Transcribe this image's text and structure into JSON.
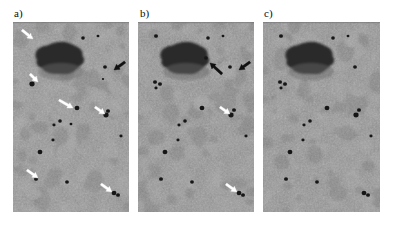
{
  "figure": {
    "type": "micrograph-panel-figure",
    "background_color": "#ffffff",
    "panel_count": 3,
    "image_width": 393,
    "image_height": 226
  },
  "panels": [
    {
      "id": "a",
      "label": "a)",
      "label_x": 14,
      "label_y": 8,
      "x": 13,
      "y": 22,
      "width": 116,
      "height": 190,
      "base_color": "#8e8e8e",
      "arrow_color": "#ffffff",
      "black_arrow_color": "#111111",
      "blob": {
        "cx": 48,
        "cy": 36,
        "rx": 22,
        "ry": 16,
        "color": "#2a2a2a"
      },
      "particles": [
        {
          "x": 17,
          "y": 14,
          "r": 2.0
        },
        {
          "x": 70,
          "y": 16,
          "r": 1.8
        },
        {
          "x": 85,
          "y": 14,
          "r": 1.4
        },
        {
          "x": 92,
          "y": 45,
          "r": 1.9
        },
        {
          "x": 19,
          "y": 62,
          "r": 2.6
        },
        {
          "x": 64,
          "y": 86,
          "r": 2.4
        },
        {
          "x": 93,
          "y": 93,
          "r": 2.6
        },
        {
          "x": 95,
          "y": 89,
          "r": 2.0
        },
        {
          "x": 47,
          "y": 99,
          "r": 1.8
        },
        {
          "x": 41,
          "y": 103,
          "r": 1.6
        },
        {
          "x": 40,
          "y": 118,
          "r": 1.6
        },
        {
          "x": 27,
          "y": 130,
          "r": 2.4
        },
        {
          "x": 108,
          "y": 114,
          "r": 1.6
        },
        {
          "x": 23,
          "y": 157,
          "r": 2.0
        },
        {
          "x": 54,
          "y": 160,
          "r": 1.9
        },
        {
          "x": 101,
          "y": 171,
          "r": 2.4
        },
        {
          "x": 105,
          "y": 173,
          "r": 2.0
        },
        {
          "x": 90,
          "y": 57,
          "r": 1.2
        },
        {
          "x": 58,
          "y": 102,
          "r": 1.4
        }
      ],
      "arrows": [
        {
          "style": "white",
          "x1": 9,
          "y1": 8,
          "x2": 20,
          "y2": 17
        },
        {
          "style": "white",
          "x1": 17,
          "y1": 52,
          "x2": 25,
          "y2": 60
        },
        {
          "style": "black",
          "x1": 112,
          "y1": 40,
          "x2": 101,
          "y2": 48
        },
        {
          "style": "white",
          "x1": 46,
          "y1": 78,
          "x2": 60,
          "y2": 86
        },
        {
          "style": "white",
          "x1": 82,
          "y1": 85,
          "x2": 92,
          "y2": 92
        },
        {
          "style": "white",
          "x1": 14,
          "y1": 148,
          "x2": 25,
          "y2": 156
        },
        {
          "style": "white",
          "x1": 88,
          "y1": 162,
          "x2": 99,
          "y2": 170
        }
      ]
    },
    {
      "id": "b",
      "label": "b)",
      "label_x": 140,
      "label_y": 8,
      "x": 138,
      "y": 22,
      "width": 116,
      "height": 190,
      "base_color": "#8c8c8c",
      "arrow_color": "#ffffff",
      "black_arrow_color": "#111111",
      "blob": {
        "cx": 48,
        "cy": 36,
        "rx": 22,
        "ry": 16,
        "color": "#2a2a2a"
      },
      "particles": [
        {
          "x": 18,
          "y": 14,
          "r": 2.0
        },
        {
          "x": 70,
          "y": 16,
          "r": 1.8
        },
        {
          "x": 85,
          "y": 14,
          "r": 1.4
        },
        {
          "x": 92,
          "y": 45,
          "r": 1.9
        },
        {
          "x": 17,
          "y": 60,
          "r": 2.0
        },
        {
          "x": 22,
          "y": 62,
          "r": 2.0
        },
        {
          "x": 18,
          "y": 66,
          "r": 1.6
        },
        {
          "x": 64,
          "y": 86,
          "r": 2.4
        },
        {
          "x": 93,
          "y": 93,
          "r": 2.6
        },
        {
          "x": 96,
          "y": 88,
          "r": 2.0
        },
        {
          "x": 47,
          "y": 99,
          "r": 1.8
        },
        {
          "x": 41,
          "y": 103,
          "r": 1.6
        },
        {
          "x": 40,
          "y": 118,
          "r": 1.6
        },
        {
          "x": 27,
          "y": 130,
          "r": 2.4
        },
        {
          "x": 108,
          "y": 114,
          "r": 1.6
        },
        {
          "x": 23,
          "y": 157,
          "r": 2.0
        },
        {
          "x": 54,
          "y": 160,
          "r": 1.9
        },
        {
          "x": 101,
          "y": 171,
          "r": 2.4
        },
        {
          "x": 105,
          "y": 173,
          "r": 2.0
        },
        {
          "x": 68,
          "y": 36,
          "r": 1.8
        }
      ],
      "arrows": [
        {
          "style": "black",
          "x1": 84,
          "y1": 52,
          "x2": 72,
          "y2": 41
        },
        {
          "style": "black",
          "x1": 112,
          "y1": 40,
          "x2": 101,
          "y2": 48
        },
        {
          "style": "white",
          "x1": 82,
          "y1": 85,
          "x2": 92,
          "y2": 92
        },
        {
          "style": "white",
          "x1": 88,
          "y1": 162,
          "x2": 99,
          "y2": 170
        }
      ]
    },
    {
      "id": "c",
      "label": "c)",
      "label_x": 264,
      "label_y": 8,
      "x": 263,
      "y": 22,
      "width": 117,
      "height": 190,
      "base_color": "#8c8c8c",
      "arrow_color": "#ffffff",
      "black_arrow_color": "#111111",
      "blob": {
        "cx": 48,
        "cy": 36,
        "rx": 22,
        "ry": 16,
        "color": "#2a2a2a"
      },
      "particles": [
        {
          "x": 18,
          "y": 14,
          "r": 2.0
        },
        {
          "x": 70,
          "y": 16,
          "r": 1.8
        },
        {
          "x": 85,
          "y": 14,
          "r": 1.4
        },
        {
          "x": 92,
          "y": 45,
          "r": 1.9
        },
        {
          "x": 17,
          "y": 60,
          "r": 2.0
        },
        {
          "x": 22,
          "y": 62,
          "r": 2.0
        },
        {
          "x": 18,
          "y": 66,
          "r": 1.6
        },
        {
          "x": 64,
          "y": 86,
          "r": 2.4
        },
        {
          "x": 93,
          "y": 93,
          "r": 2.6
        },
        {
          "x": 96,
          "y": 88,
          "r": 2.0
        },
        {
          "x": 47,
          "y": 99,
          "r": 1.8
        },
        {
          "x": 41,
          "y": 103,
          "r": 1.6
        },
        {
          "x": 40,
          "y": 118,
          "r": 1.6
        },
        {
          "x": 27,
          "y": 130,
          "r": 2.4
        },
        {
          "x": 108,
          "y": 114,
          "r": 1.6
        },
        {
          "x": 23,
          "y": 157,
          "r": 2.0
        },
        {
          "x": 54,
          "y": 160,
          "r": 1.9
        },
        {
          "x": 101,
          "y": 171,
          "r": 2.4
        },
        {
          "x": 105,
          "y": 173,
          "r": 2.0
        }
      ],
      "arrows": []
    }
  ]
}
